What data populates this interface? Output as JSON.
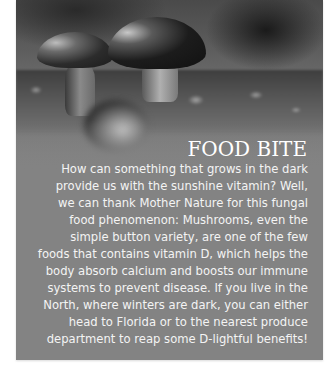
{
  "article": {
    "title": "FOOD BITE",
    "image": {
      "subject": "mushrooms-on-moss-photo"
    },
    "body_lines": [
      "How can something that grows in the dark",
      "provide us with the sunshine vitamin? Well,",
      "we can thank Mother Nature for this fungal",
      "food phenomenon: Mushrooms, even the",
      "simple button variety, are one of the few",
      "foods that contains vitamin D, which helps the",
      "body absorb calcium and boosts our immune",
      "systems to prevent disease. If you live in the",
      "North, where winters are dark, you can either",
      "head to Florida or to the nearest produce",
      "department to reap some D-lightful benefits!"
    ]
  },
  "colors": {
    "box_background": "#838383",
    "text": "#ffffff"
  }
}
